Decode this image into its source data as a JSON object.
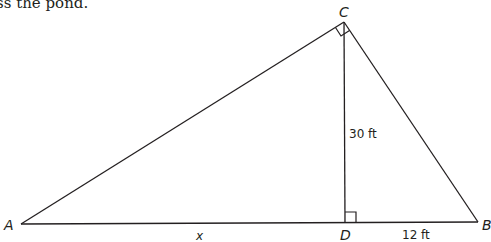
{
  "caption_fragment": "ss the pond.",
  "diagram": {
    "type": "right-triangle-with-altitude",
    "vertices": {
      "A": {
        "label": "A"
      },
      "B": {
        "label": "B"
      },
      "C": {
        "label": "C"
      },
      "D": {
        "label": "D"
      }
    },
    "measurements": {
      "CD": "30 ft",
      "DB": "12 ft",
      "AD": "x"
    },
    "right_angles": [
      "C",
      "D"
    ],
    "stroke_color": "#231f20"
  }
}
